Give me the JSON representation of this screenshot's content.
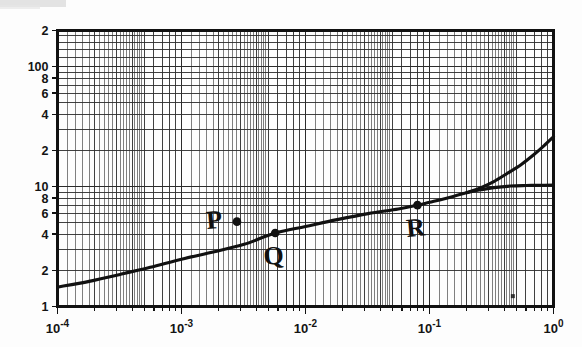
{
  "figure": {
    "kind": "log-log-graph",
    "background_color": "#fdfdfd",
    "ink_color": "#111111",
    "grid_color": "#2b2b2b"
  },
  "chart_data": {
    "type": "line",
    "title": "",
    "subtitle": "",
    "xlabel": "",
    "ylabel": "",
    "xscale": "log",
    "yscale": "log",
    "xlim": [
      0.0001,
      1.0
    ],
    "ylim": [
      1,
      200
    ],
    "grid": true,
    "grid_style": "log-log minor and major rulings",
    "legend": "none",
    "x_tick_labels": [
      "10-4",
      "10-3",
      "10-2",
      "10-1",
      "100"
    ],
    "x_tick_mantissas": [
      "10",
      "10",
      "10",
      "10",
      "10"
    ],
    "x_tick_exponents": [
      "-4",
      "-3",
      "-2",
      "-1",
      "0"
    ],
    "x_tick_values": [
      0.0001,
      0.001,
      0.01,
      0.1,
      1
    ],
    "y_tick_labels": [
      "2",
      "100",
      "8",
      "6",
      "4",
      "2",
      "10",
      "8",
      "6",
      "4",
      "2",
      "1"
    ],
    "y_tick_values": [
      200,
      100,
      80,
      60,
      40,
      20,
      10,
      8,
      6,
      4,
      2,
      1
    ],
    "series": [
      {
        "name": "main-curve",
        "style": "solid-thick",
        "points": [
          [
            0.0001,
            1.45
          ],
          [
            0.00018,
            1.62
          ],
          [
            0.00032,
            1.85
          ],
          [
            0.00056,
            2.12
          ],
          [
            0.001,
            2.48
          ],
          [
            0.0018,
            2.85
          ],
          [
            0.0032,
            3.3
          ],
          [
            0.0057,
            4.1
          ],
          [
            0.01,
            4.65
          ],
          [
            0.018,
            5.3
          ],
          [
            0.032,
            5.95
          ],
          [
            0.056,
            6.5
          ],
          [
            0.08,
            7.0
          ],
          [
            0.1,
            7.4
          ],
          [
            0.15,
            8.2
          ],
          [
            0.2,
            8.9
          ]
        ]
      },
      {
        "name": "upper-branch",
        "style": "solid-thick",
        "points": [
          [
            0.2,
            8.9
          ],
          [
            0.26,
            9.8
          ],
          [
            0.33,
            11.0
          ],
          [
            0.42,
            12.8
          ],
          [
            0.55,
            15.3
          ],
          [
            0.7,
            18.6
          ],
          [
            0.85,
            22.2
          ],
          [
            1.0,
            26.0
          ]
        ]
      },
      {
        "name": "plateau-branch",
        "style": "solid-thick",
        "points": [
          [
            0.2,
            8.9
          ],
          [
            0.26,
            9.4
          ],
          [
            0.33,
            9.8
          ],
          [
            0.45,
            10.1
          ],
          [
            0.6,
            10.2
          ],
          [
            0.8,
            10.25
          ],
          [
            1.0,
            10.3
          ]
        ]
      }
    ],
    "annotations": [
      {
        "name": "point-P",
        "label": "P",
        "x": 0.0028,
        "y": 5.1,
        "marker": "filled-circle",
        "label_position": "left",
        "on_curve": false
      },
      {
        "name": "point-Q",
        "label": "Q",
        "x": 0.0057,
        "y": 4.1,
        "marker": "filled-circle",
        "label_position": "below",
        "on_curve": true
      },
      {
        "name": "point-R",
        "label": "R",
        "x": 0.08,
        "y": 7.0,
        "marker": "filled-circle",
        "label_position": "below",
        "on_curve": true
      }
    ],
    "marks": [
      {
        "name": "scan-speck",
        "x": 0.47,
        "y": 1.22,
        "description": "small dark speck artifact on the page"
      }
    ]
  }
}
